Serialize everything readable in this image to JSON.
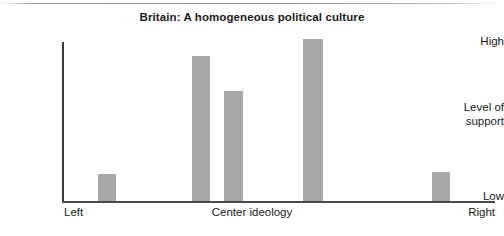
{
  "chart_data": {
    "type": "bar",
    "title": "Britain: A homogeneous political culture",
    "xlabel": "Center ideology",
    "ylabel": "Level of support",
    "categories": [
      "Left",
      "",
      "",
      "",
      "Right"
    ],
    "values": [
      17,
      91,
      69,
      102,
      18
    ],
    "ylim": [
      0,
      100
    ],
    "ytick_labels": [
      "Low",
      "High"
    ],
    "xtick_labels": [
      "Left",
      "Center ideology",
      "Right"
    ],
    "grid": false,
    "legend": null,
    "bar_color": "#a8a8a8",
    "axis_color": "#3a3a3a",
    "bars": [
      {
        "name": "far-left",
        "value": 17,
        "x": 36,
        "width": 18
      },
      {
        "name": "center-left",
        "value": 91,
        "x": 130,
        "width": 18
      },
      {
        "name": "center",
        "value": 69,
        "x": 162,
        "width": 19
      },
      {
        "name": "center-right",
        "value": 102,
        "x": 241,
        "width": 20
      },
      {
        "name": "far-right",
        "value": 18,
        "x": 370,
        "width": 18
      }
    ]
  },
  "axis": {
    "y_high": "High",
    "y_low": "Low",
    "y_title_line1": "Level of",
    "y_title_line2": "support",
    "x_left": "Left",
    "x_center": "Center ideology",
    "x_right": "Right"
  }
}
